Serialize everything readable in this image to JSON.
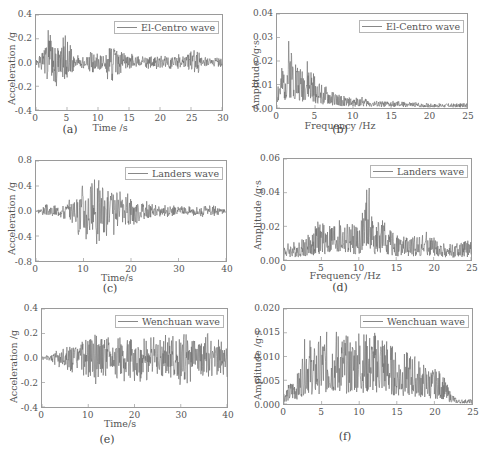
{
  "chart_data": [
    {
      "id": "a",
      "type": "line",
      "caption": "(a)",
      "title": "",
      "legend": [
        "El-Centro wave"
      ],
      "xlabel": "Time /s",
      "ylabel": "Acceleration /g",
      "xlim": [
        0,
        30
      ],
      "ylim": [
        -0.4,
        0.4
      ],
      "xticks": [
        "0",
        "5",
        "10",
        "15",
        "20",
        "25",
        "30"
      ],
      "yticks": [
        "0.4",
        "0.2",
        "0.0",
        "-0.2",
        "-0.4"
      ],
      "series": [
        {
          "name": "El-Centro wave",
          "peak_positive": 0.33,
          "peak_negative": -0.27,
          "strong_motion_window_s": [
            1,
            6
          ],
          "envelope": [
            [
              0,
              0.02
            ],
            [
              1,
              0.1
            ],
            [
              2,
              0.33
            ],
            [
              3,
              0.2
            ],
            [
              4,
              0.25
            ],
            [
              5,
              0.25
            ],
            [
              6,
              0.08
            ],
            [
              8,
              0.06
            ],
            [
              9,
              0.13
            ],
            [
              10,
              0.1
            ],
            [
              11,
              0.1
            ],
            [
              12,
              0.2
            ],
            [
              14,
              0.1
            ],
            [
              16,
              0.07
            ],
            [
              20,
              0.06
            ],
            [
              24,
              0.08
            ],
            [
              26,
              0.12
            ],
            [
              27,
              0.06
            ],
            [
              30,
              0.04
            ]
          ]
        }
      ],
      "grid": false,
      "legend_position": "upper right"
    },
    {
      "id": "b",
      "type": "line",
      "caption": "(b)",
      "title": "",
      "legend": [
        "El-Centro wave"
      ],
      "xlabel": "Frequency /Hz",
      "ylabel": "Amplitude /g·s",
      "xlim": [
        0,
        25
      ],
      "ylim": [
        0.0,
        0.04
      ],
      "xticks": [
        "0",
        "5",
        "10",
        "15",
        "20",
        "25"
      ],
      "yticks": [
        "0.04",
        "0.03",
        "0.02",
        "0.01",
        "0.00"
      ],
      "series": [
        {
          "name": "El-Centro wave",
          "peak": 0.03,
          "peak_frequency_hz": 1.5,
          "envelope": [
            [
              0,
              0.012
            ],
            [
              1,
              0.02
            ],
            [
              1.5,
              0.03
            ],
            [
              2,
              0.028
            ],
            [
              3,
              0.018
            ],
            [
              4,
              0.02
            ],
            [
              5,
              0.014
            ],
            [
              6,
              0.01
            ],
            [
              7,
              0.008
            ],
            [
              8,
              0.006
            ],
            [
              10,
              0.004
            ],
            [
              11,
              0.005
            ],
            [
              13,
              0.003
            ],
            [
              15,
              0.003
            ],
            [
              16,
              0.003
            ],
            [
              20,
              0.002
            ],
            [
              25,
              0.002
            ]
          ]
        }
      ],
      "grid": false,
      "legend_position": "upper right"
    },
    {
      "id": "c",
      "type": "line",
      "caption": "(c)",
      "title": "",
      "legend": [
        "Landers wave"
      ],
      "xlabel": "Time/s",
      "ylabel": "Acceleration /g",
      "xlim": [
        0,
        40
      ],
      "ylim": [
        -0.8,
        0.8
      ],
      "xticks": [
        "0",
        "10",
        "20",
        "30",
        "40"
      ],
      "yticks": [
        "0.8",
        "0.4",
        "0.0",
        "-0.4",
        "-0.8"
      ],
      "series": [
        {
          "name": "Landers wave",
          "peak_positive": 0.65,
          "peak_negative": -0.8,
          "strong_motion_window_s": [
            8,
            21
          ],
          "envelope": [
            [
              0,
              0.01
            ],
            [
              2,
              0.12
            ],
            [
              5,
              0.12
            ],
            [
              8,
              0.25
            ],
            [
              10,
              0.65
            ],
            [
              11,
              0.5
            ],
            [
              13,
              0.65
            ],
            [
              15,
              0.5
            ],
            [
              17,
              0.35
            ],
            [
              20,
              0.3
            ],
            [
              21,
              0.25
            ],
            [
              25,
              0.12
            ],
            [
              30,
              0.08
            ],
            [
              35,
              0.12
            ],
            [
              40,
              0.05
            ]
          ]
        }
      ],
      "grid": false,
      "legend_position": "upper right"
    },
    {
      "id": "d",
      "type": "line",
      "caption": "(d)",
      "title": "",
      "legend": [
        "Landers wave"
      ],
      "xlabel": "Frequency /Hz",
      "ylabel": "Amplitude /g·s",
      "xlim": [
        0,
        25
      ],
      "ylim": [
        0.0,
        0.06
      ],
      "xticks": [
        "0",
        "5",
        "10",
        "15",
        "20",
        "25"
      ],
      "yticks": [
        "0.06",
        "0.04",
        "0.02",
        "0.00"
      ],
      "series": [
        {
          "name": "Landers wave",
          "peak": 0.047,
          "peak_frequency_hz": 11.3,
          "envelope": [
            [
              0,
              0.01
            ],
            [
              2,
              0.012
            ],
            [
              4,
              0.018
            ],
            [
              4.5,
              0.024
            ],
            [
              6,
              0.022
            ],
            [
              7,
              0.024
            ],
            [
              9,
              0.022
            ],
            [
              10,
              0.02
            ],
            [
              11.3,
              0.047
            ],
            [
              12,
              0.022
            ],
            [
              13,
              0.025
            ],
            [
              15,
              0.015
            ],
            [
              17,
              0.014
            ],
            [
              19,
              0.017
            ],
            [
              21,
              0.01
            ],
            [
              23,
              0.01
            ],
            [
              25,
              0.012
            ]
          ]
        }
      ],
      "grid": false,
      "legend_position": "upper right"
    },
    {
      "id": "e",
      "type": "line",
      "caption": "(e)",
      "title": "",
      "legend": [
        "Wenchuan wave"
      ],
      "xlabel": "Time/s",
      "ylabel": "Acceleration /g",
      "xlim": [
        0,
        40
      ],
      "ylim": [
        -0.4,
        0.4
      ],
      "xticks": [
        "0",
        "10",
        "20",
        "30",
        "40"
      ],
      "yticks": [
        "0.4",
        "0.2",
        "0.0",
        "-0.2",
        "-0.4"
      ],
      "series": [
        {
          "name": "Wenchuan wave",
          "peak_positive": 0.24,
          "peak_negative": -0.22,
          "envelope": [
            [
              0,
              0.02
            ],
            [
              2,
              0.03
            ],
            [
              3,
              0.1
            ],
            [
              5,
              0.12
            ],
            [
              8,
              0.14
            ],
            [
              11,
              0.22
            ],
            [
              14,
              0.2
            ],
            [
              17,
              0.22
            ],
            [
              21,
              0.24
            ],
            [
              24,
              0.18
            ],
            [
              26,
              0.2
            ],
            [
              30,
              0.24
            ],
            [
              33,
              0.2
            ],
            [
              37,
              0.23
            ],
            [
              40,
              0.2
            ]
          ]
        }
      ],
      "grid": false,
      "legend_position": "upper right"
    },
    {
      "id": "f",
      "type": "line",
      "caption": "(f)",
      "title": "",
      "legend": [
        "Wenchuan wave"
      ],
      "xlabel": "",
      "ylabel": "Amplitude /g·s",
      "xlim": [
        0,
        25
      ],
      "ylim": [
        0.0,
        0.02
      ],
      "xticks": [
        "0",
        "5",
        "10",
        "15",
        "20",
        "25"
      ],
      "yticks": [
        "0.020",
        "0.015",
        "0.010",
        "0.005",
        "0.000"
      ],
      "series": [
        {
          "name": "Wenchuan wave",
          "peak": 0.017,
          "peak_frequency_hz": 9.7,
          "envelope": [
            [
              0,
              0.003
            ],
            [
              1,
              0.005
            ],
            [
              2,
              0.007
            ],
            [
              3,
              0.016
            ],
            [
              4,
              0.012
            ],
            [
              5,
              0.015
            ],
            [
              7,
              0.016
            ],
            [
              9,
              0.014
            ],
            [
              9.7,
              0.017
            ],
            [
              11,
              0.015
            ],
            [
              13,
              0.016
            ],
            [
              15,
              0.011
            ],
            [
              17,
              0.011
            ],
            [
              19,
              0.008
            ],
            [
              21,
              0.007
            ],
            [
              22,
              0.003
            ],
            [
              23,
              0.001
            ],
            [
              25,
              0.001
            ]
          ]
        }
      ],
      "grid": false,
      "legend_position": "upper right"
    }
  ]
}
